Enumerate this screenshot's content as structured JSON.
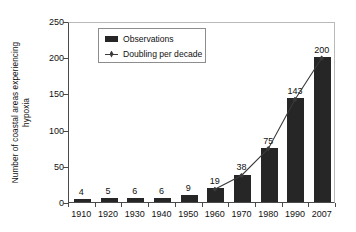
{
  "chart_data": {
    "type": "bar",
    "title": "",
    "subtitle": "",
    "xlabel": "",
    "ylabel": "Number of coastal areas experiencing hypoxia",
    "ylabel_line1": "Number of coastal areas experiencing",
    "ylabel_line2": "hypoxia",
    "categories": [
      "1910",
      "1920",
      "1930",
      "1940",
      "1950",
      "1960",
      "1970",
      "1980",
      "1990",
      "2007"
    ],
    "ylim": [
      0,
      250
    ],
    "yticks": [
      0,
      50,
      100,
      150,
      200,
      250
    ],
    "ytick_labels": [
      "0",
      "50",
      "100",
      "150",
      "200",
      "250"
    ],
    "grid": false,
    "legend_position": "upper-left-inside",
    "series": [
      {
        "name": "Observations",
        "type": "bar",
        "color": "#262626",
        "values": [
          4,
          5,
          6,
          6,
          9,
          19,
          38,
          75,
          143,
          200
        ],
        "data_labels": [
          "4",
          "5",
          "6",
          "6",
          "9",
          "19",
          "38",
          "75",
          "143",
          "200"
        ]
      },
      {
        "name": "Doubling per decade",
        "type": "line",
        "color": "#3a3a3a",
        "x": [
          "1960",
          "1970",
          "1980",
          "1990",
          "2007"
        ],
        "values": [
          19,
          38,
          75,
          143,
          200
        ]
      }
    ],
    "legend": [
      {
        "label": "Observations",
        "marker": "filled-rectangle",
        "color": "#262626"
      },
      {
        "label": "Doubling per decade",
        "marker": "line-with-diamond",
        "color": "#3a3a3a"
      }
    ]
  },
  "colors": {
    "bar": "#262626",
    "line": "#3a3a3a",
    "axis": "#4a4a4a",
    "frame": "#b9b9b9",
    "background": "#ffffff",
    "text": "#111111"
  }
}
